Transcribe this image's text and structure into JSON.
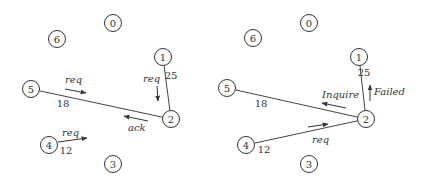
{
  "panels": [
    {
      "id": "left",
      "nodes": [
        {
          "label": "0",
          "x": 113,
          "y": 23
        },
        {
          "label": "6",
          "x": 57,
          "y": 39
        },
        {
          "label": "1",
          "x": 163,
          "y": 57
        },
        {
          "label": "5",
          "x": 31,
          "y": 89
        },
        {
          "label": "2",
          "x": 171,
          "y": 119
        },
        {
          "label": "4",
          "x": 49,
          "y": 145
        },
        {
          "label": "3",
          "x": 113,
          "y": 164
        }
      ],
      "edges": [
        {
          "from": "1",
          "to": "2",
          "weight": "25"
        },
        {
          "from": "5",
          "to": "2",
          "weight": "18"
        }
      ],
      "messages": [
        {
          "text": "req",
          "label_x": 65,
          "label_y": 83,
          "x1": 65,
          "y1": 89,
          "x2": 86,
          "y2": 93
        },
        {
          "text": "req",
          "label_x": 143,
          "label_y": 82,
          "x1": 157,
          "y1": 86,
          "x2": 158,
          "y2": 101
        },
        {
          "text": "ack",
          "label_x": 128,
          "label_y": 131,
          "x1": 148,
          "y1": 121,
          "x2": 124,
          "y2": 116
        },
        {
          "text": "req",
          "label_x": 62,
          "label_y": 136,
          "x1": 58,
          "y1": 142,
          "x2": 87,
          "y2": 138
        }
      ],
      "weight_labels": [
        {
          "text": "25",
          "x": 171,
          "y": 79
        },
        {
          "text": "18",
          "x": 63,
          "y": 107
        },
        {
          "text": "12",
          "x": 66,
          "y": 154
        }
      ]
    },
    {
      "id": "right",
      "nodes": [
        {
          "label": "0",
          "x": 309,
          "y": 23
        },
        {
          "label": "6",
          "x": 253,
          "y": 38
        },
        {
          "label": "1",
          "x": 359,
          "y": 57
        },
        {
          "label": "5",
          "x": 227,
          "y": 88
        },
        {
          "label": "2",
          "x": 366,
          "y": 119
        },
        {
          "label": "4",
          "x": 246,
          "y": 145
        },
        {
          "label": "3",
          "x": 309,
          "y": 164
        }
      ],
      "edges": [
        {
          "from": "1",
          "to": "2",
          "weight": "25"
        },
        {
          "from": "5",
          "to": "2",
          "weight": "18"
        },
        {
          "from": "4",
          "to": "2",
          "weight": "12"
        }
      ],
      "messages": [
        {
          "text": "Inquire",
          "label_x": 322,
          "label_y": 98,
          "x1": 346,
          "y1": 108,
          "x2": 322,
          "y2": 103
        },
        {
          "text": "Failed",
          "label_x": 374,
          "label_y": 95,
          "x1": 370,
          "y1": 101,
          "x2": 370,
          "y2": 85
        },
        {
          "text": "req",
          "label_x": 312,
          "label_y": 143,
          "x1": 308,
          "y1": 127,
          "x2": 328,
          "y2": 124
        }
      ],
      "weight_labels": [
        {
          "text": "25",
          "x": 364,
          "y": 76
        },
        {
          "text": "18",
          "x": 261,
          "y": 107
        },
        {
          "text": "12",
          "x": 264,
          "y": 153
        }
      ]
    }
  ]
}
